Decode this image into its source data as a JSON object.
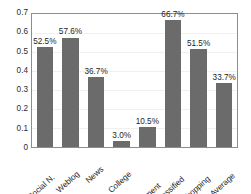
{
  "chart_data": {
    "type": "bar",
    "title": "",
    "xlabel": "",
    "ylabel": "",
    "categories": [
      "Social N.",
      "Weblog",
      "News",
      "College",
      "Government",
      "Classified",
      "Shopping",
      "Average"
    ],
    "values": [
      0.525,
      0.576,
      0.367,
      0.03,
      0.105,
      0.667,
      0.515,
      0.337
    ],
    "data_labels": [
      "52.5%",
      "57.6%",
      "36.7%",
      "3.0%",
      "10.5%",
      "66.7%",
      "51.5%",
      "33.7%"
    ],
    "ylim": [
      0,
      0.7
    ],
    "ytick_labels": [
      "0.7",
      "0.6",
      "0.5",
      "0.4",
      "0.3",
      "0.2",
      "0.1",
      "0"
    ],
    "ytick_values": [
      0.7,
      0.6,
      0.5,
      0.4,
      0.3,
      0.2,
      0.1,
      0
    ],
    "grid": true,
    "legend": "none",
    "bar_color": "#6b6b6b",
    "frame_color": "#8d8d8d",
    "text_color": "#1e1e1e",
    "background": "#ffffff"
  }
}
